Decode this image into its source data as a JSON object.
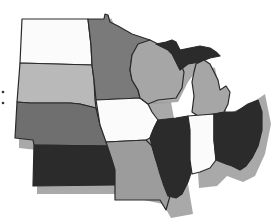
{
  "map": {
    "region": "Midwest United States",
    "palette": {
      "white": "#fbfbfb",
      "light": "#b9b9b9",
      "medium_light": "#a6a6a6",
      "medium": "#9c9c9c",
      "medium_dark": "#6f6f6f",
      "dark": "#7a7a7a",
      "very_dark": "#2b2b2b",
      "shadow": "#9a9a9a",
      "border": "#2a2a2a"
    },
    "states": [
      {
        "id": "north-dakota",
        "name": "North Dakota",
        "shade": "white"
      },
      {
        "id": "south-dakota",
        "name": "South Dakota",
        "shade": "light"
      },
      {
        "id": "nebraska",
        "name": "Nebraska",
        "shade": "medium_dark"
      },
      {
        "id": "kansas",
        "name": "Kansas",
        "shade": "very_dark"
      },
      {
        "id": "minnesota",
        "name": "Minnesota",
        "shade": "dark"
      },
      {
        "id": "iowa",
        "name": "Iowa",
        "shade": "white"
      },
      {
        "id": "missouri",
        "name": "Missouri",
        "shade": "medium"
      },
      {
        "id": "wisconsin",
        "name": "Wisconsin",
        "shade": "medium_light"
      },
      {
        "id": "illinois",
        "name": "Illinois",
        "shade": "very_dark"
      },
      {
        "id": "michigan-upper",
        "name": "Michigan (Upper Peninsula)",
        "shade": "very_dark"
      },
      {
        "id": "michigan-lower",
        "name": "Michigan (Lower Peninsula)",
        "shade": "medium_light"
      },
      {
        "id": "indiana",
        "name": "Indiana",
        "shade": "white"
      },
      {
        "id": "ohio",
        "name": "Ohio",
        "shade": "very_dark"
      }
    ]
  }
}
